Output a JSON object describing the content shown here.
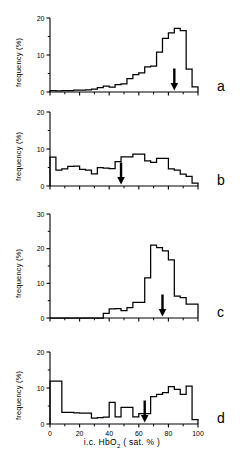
{
  "figure": {
    "xlabel_prefix": "i.c. HbO",
    "xlabel_sub": "2",
    "xlabel_suffix": " ( sat. % )",
    "ylabel": "frequency (%)",
    "ink_color": "#000000",
    "background_color": "#ffffff"
  },
  "chart_data": [
    {
      "type": "bar",
      "panel": "a",
      "title": "",
      "xlabel": "i.c. HbO2 ( sat. % )",
      "ylabel": "frequency (%)",
      "xlim": [
        0,
        100
      ],
      "ylim": [
        0,
        20
      ],
      "xticks": [
        0,
        20,
        40,
        60,
        80,
        100
      ],
      "yticks": [
        0,
        10,
        20
      ],
      "xtick_labels": [
        "0",
        "20",
        "40",
        "60",
        "80",
        "100"
      ],
      "ytick_labels": [
        "0",
        "10",
        "20"
      ],
      "grid": false,
      "bin_width": 4,
      "categories": [
        "0-4",
        "4-8",
        "8-12",
        "12-16",
        "16-20",
        "20-24",
        "24-28",
        "28-32",
        "32-36",
        "36-40",
        "40-44",
        "44-48",
        "48-52",
        "52-56",
        "56-60",
        "60-64",
        "64-68",
        "68-72",
        "72-76",
        "76-80",
        "80-84",
        "84-88",
        "88-92",
        "92-96",
        "96-100"
      ],
      "values": [
        0.4,
        0.3,
        0.4,
        0.4,
        0.5,
        0.5,
        0.6,
        0.8,
        1.2,
        1.6,
        1.3,
        2.0,
        2.2,
        3.6,
        4.7,
        5.2,
        6.8,
        7.0,
        10.8,
        14.5,
        16.0,
        17.2,
        16.6,
        6.2,
        1.4
      ],
      "annotations": [
        {
          "type": "arrow",
          "direction": "down",
          "x": 84,
          "label": ""
        }
      ]
    },
    {
      "type": "bar",
      "panel": "b",
      "title": "",
      "xlabel": "i.c. HbO2 ( sat. % )",
      "ylabel": "frequency (%)",
      "xlim": [
        0,
        100
      ],
      "ylim": [
        0,
        20
      ],
      "xticks": [
        0,
        20,
        40,
        60,
        80,
        100
      ],
      "yticks": [
        0,
        10,
        20
      ],
      "xtick_labels": [
        "0",
        "20",
        "40",
        "60",
        "80",
        "100"
      ],
      "ytick_labels": [
        "0",
        "10",
        "20"
      ],
      "grid": false,
      "bin_width": 4,
      "categories": [
        "0-4",
        "4-8",
        "8-12",
        "12-16",
        "16-20",
        "20-24",
        "24-28",
        "28-32",
        "32-36",
        "36-40",
        "40-44",
        "44-48",
        "48-52",
        "52-56",
        "56-60",
        "60-64",
        "64-68",
        "68-72",
        "72-76",
        "76-80",
        "80-84",
        "84-88",
        "88-92",
        "92-96",
        "96-100"
      ],
      "values": [
        7.8,
        4.3,
        4.6,
        5.3,
        5.4,
        4.5,
        4.3,
        3.3,
        5.0,
        4.8,
        4.7,
        6.6,
        7.9,
        7.9,
        8.6,
        8.6,
        6.8,
        6.4,
        7.5,
        7.5,
        4.6,
        4.3,
        3.2,
        2.6,
        0.8
      ],
      "annotations": [
        {
          "type": "arrow",
          "direction": "down",
          "x": 48,
          "label": ""
        }
      ]
    },
    {
      "type": "bar",
      "panel": "c",
      "title": "",
      "xlabel": "i.c. HbO2 ( sat. % )",
      "ylabel": "frequency (%)",
      "xlim": [
        0,
        100
      ],
      "ylim": [
        0,
        30
      ],
      "xticks": [
        0,
        20,
        40,
        60,
        80,
        100
      ],
      "yticks": [
        0,
        10,
        20,
        30
      ],
      "xtick_labels": [
        "0",
        "20",
        "40",
        "60",
        "80",
        "100"
      ],
      "ytick_labels": [
        "0",
        "10",
        "20",
        "30"
      ],
      "grid": false,
      "bin_width": 4,
      "categories": [
        "0-4",
        "4-8",
        "8-12",
        "12-16",
        "16-20",
        "20-24",
        "24-28",
        "28-32",
        "32-36",
        "36-40",
        "40-44",
        "44-48",
        "48-52",
        "52-56",
        "56-60",
        "60-64",
        "64-68",
        "68-72",
        "72-76",
        "76-80",
        "80-84",
        "84-88",
        "88-92",
        "92-96",
        "96-100"
      ],
      "values": [
        0.0,
        0.0,
        0.0,
        0.0,
        0.0,
        0.0,
        0.0,
        0.0,
        0.0,
        1.3,
        2.6,
        2.7,
        2.1,
        3.0,
        4.5,
        4.5,
        11.6,
        21.0,
        20.3,
        19.4,
        16.8,
        6.3,
        5.9,
        4.0,
        4.0
      ],
      "annotations": [
        {
          "type": "arrow",
          "direction": "down",
          "x": 76,
          "label": ""
        }
      ]
    },
    {
      "type": "bar",
      "panel": "d",
      "title": "",
      "xlabel": "i.c. HbO2 ( sat. % )",
      "ylabel": "frequency (%)",
      "xlim": [
        0,
        100
      ],
      "ylim": [
        0,
        20
      ],
      "xticks": [
        0,
        20,
        40,
        60,
        80,
        100
      ],
      "yticks": [
        0,
        10,
        20
      ],
      "xtick_labels": [
        "0",
        "20",
        "40",
        "60",
        "80",
        "100"
      ],
      "ytick_labels": [
        "0",
        "10",
        "20"
      ],
      "grid": false,
      "bin_width": 4,
      "categories": [
        "0-4",
        "4-8",
        "8-12",
        "12-16",
        "16-20",
        "20-24",
        "24-28",
        "28-32",
        "32-36",
        "36-40",
        "40-44",
        "44-48",
        "48-52",
        "52-56",
        "56-60",
        "60-64",
        "64-68",
        "68-72",
        "72-76",
        "76-80",
        "80-84",
        "84-88",
        "88-92",
        "92-96",
        "96-100"
      ],
      "values": [
        11.9,
        11.9,
        3.2,
        3.2,
        3.1,
        3.0,
        3.0,
        1.6,
        1.8,
        1.9,
        6.0,
        2.0,
        4.6,
        4.6,
        2.0,
        2.9,
        2.9,
        7.6,
        8.2,
        8.7,
        10.4,
        9.6,
        8.2,
        10.5,
        1.2
      ],
      "annotations": [
        {
          "type": "arrow",
          "direction": "down",
          "x": 64,
          "label": ""
        }
      ]
    }
  ],
  "panels": [
    {
      "letter": "a"
    },
    {
      "letter": "b"
    },
    {
      "letter": "c"
    },
    {
      "letter": "d"
    }
  ]
}
